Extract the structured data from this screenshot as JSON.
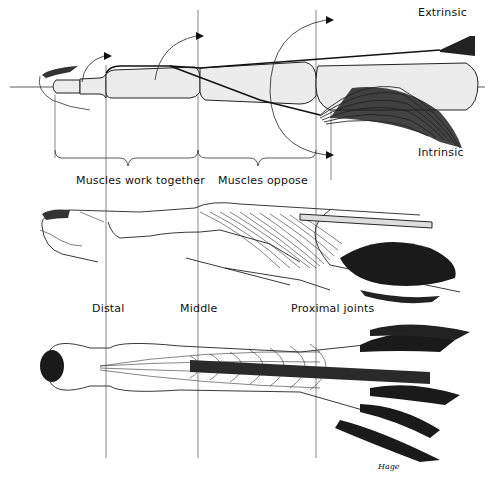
{
  "diagram": {
    "panels": [
      {
        "id": "schematic",
        "labels": {
          "extrinsic": "Extrinsic",
          "intrinsic": "Intrinsic"
        }
      },
      {
        "id": "lateral-view",
        "brackets": {
          "together": "Muscles work together",
          "oppose": "Muscles oppose"
        }
      },
      {
        "id": "dorsal-view"
      }
    ],
    "joint_labels": {
      "distal": "Distal",
      "middle": "Middle",
      "proximal": "Proximal joints"
    },
    "signature": "Hage",
    "colors": {
      "ink": "#111111",
      "bone_fill": "#ececec",
      "background": "#ffffff"
    }
  }
}
